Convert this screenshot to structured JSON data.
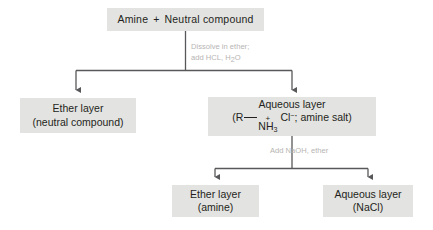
{
  "diagram": {
    "box_fill": "#e3e3e1",
    "line_color": "#58585a",
    "text_color": "#231f20",
    "reagent_text_color": "#b6b4b2"
  },
  "nodes": {
    "start": {
      "name": "starting-mixture",
      "reactant_1": "Amine",
      "plus": "+",
      "reactant_2": "Neutral compound"
    },
    "ether_neutral": {
      "name": "ether-layer-neutral-compound",
      "line1": "Ether layer",
      "line2": "(neutral compound)"
    },
    "aqueous_salt": {
      "name": "aqueous-layer-amine-salt",
      "line1": "Aqueous layer",
      "formula_open": "(R",
      "formula_bond": "—",
      "formula_charge": "+",
      "formula_nh": "NH",
      "formula_nh_sub": "3",
      "formula_cl": "Cl",
      "formula_cl_sup": "−",
      "formula_close": "; amine salt)"
    },
    "ether_amine": {
      "name": "ether-layer-amine",
      "line1": "Ether layer",
      "line2": "(amine)"
    },
    "aqueous_nacl": {
      "name": "aqueous-layer-nacl",
      "line1": "Aqueous layer",
      "line2": "(NaCl)"
    }
  },
  "reagents": {
    "step1": {
      "name": "reagent-step-1",
      "line1": "Dissolve in ether;",
      "line2_a": "add HCL, H",
      "line2_sub": "2",
      "line2_b": "O"
    },
    "step2": {
      "name": "reagent-step-2",
      "line1": "Add NaOH, ether"
    }
  }
}
